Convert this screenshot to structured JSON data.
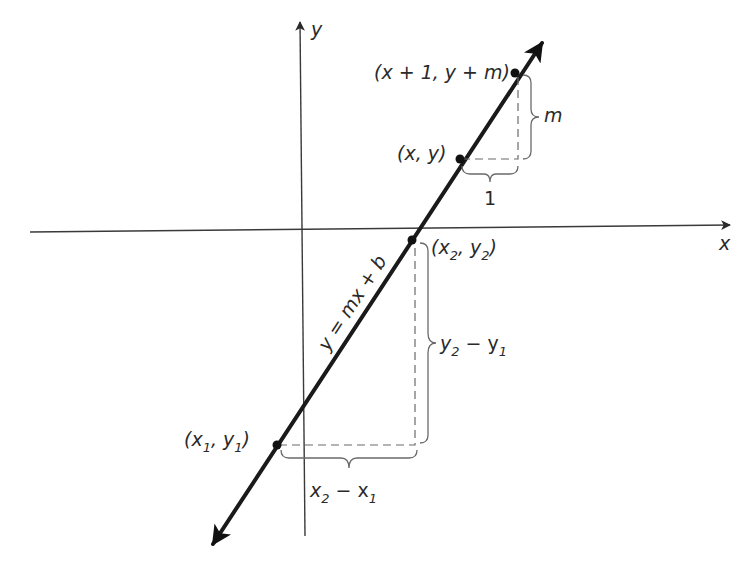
{
  "diagram": {
    "type": "slope-of-line",
    "axes": {
      "x_label": "x",
      "y_label": "y"
    },
    "line_equation": "y = mx + b",
    "points": [
      {
        "id": "p_x1y1",
        "label": "(x",
        "sub1": "1",
        "mid": ", y",
        "sub2": "1",
        "end": ")"
      },
      {
        "id": "p_x2y2",
        "label": "(x",
        "sub1": "2",
        "mid": ", y",
        "sub2": "2",
        "end": ")"
      },
      {
        "id": "p_xy",
        "label": "(x, y)"
      },
      {
        "id": "p_x1ym",
        "label": "(x + 1, y + m)"
      }
    ],
    "braces": {
      "run_small": "1",
      "rise_small": "m",
      "rise_big": {
        "a": "y",
        "sa": "2",
        "op": " − y",
        "sb": "1"
      },
      "run_big": {
        "a": "x",
        "sa": "2",
        "op": " − x",
        "sb": "1"
      }
    },
    "colors": {
      "line": "#1a1a1a",
      "axis": "#3a3a3a",
      "dashed": "#6a6a6a",
      "text": "#2a2a2a"
    }
  }
}
